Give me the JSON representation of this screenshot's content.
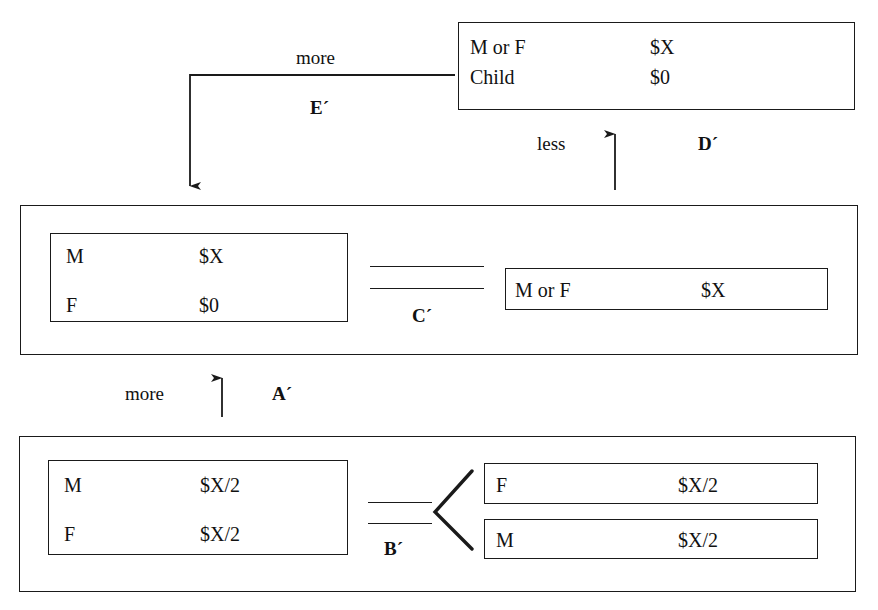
{
  "diagram": {
    "top_box": {
      "rows": [
        {
          "label": "M or F",
          "value": "$X"
        },
        {
          "label": "Child",
          "value": "$0"
        }
      ]
    },
    "middle_group": {
      "left_box": {
        "rows": [
          {
            "label": "M",
            "value": "$X"
          },
          {
            "label": "F",
            "value": "$0"
          }
        ]
      },
      "right_box": {
        "rows": [
          {
            "label": "M or F",
            "value": "$X"
          }
        ]
      },
      "connector_label": "C´"
    },
    "bottom_group": {
      "left_box": {
        "rows": [
          {
            "label": "M",
            "value": "$X/2"
          },
          {
            "label": "F",
            "value": "$X/2"
          }
        ]
      },
      "right_boxes": [
        {
          "label": "F",
          "value": "$X/2"
        },
        {
          "label": "M",
          "value": "$X/2"
        }
      ],
      "connector_label": "B´"
    },
    "arrows": {
      "e_prime": {
        "label": "E´",
        "qualifier": "more"
      },
      "d_prime": {
        "label": "D´",
        "qualifier": "less"
      },
      "a_prime": {
        "label": "A´",
        "qualifier": "more"
      }
    },
    "colors": {
      "ink": "#1a1a1a",
      "background": "#ffffff"
    }
  }
}
